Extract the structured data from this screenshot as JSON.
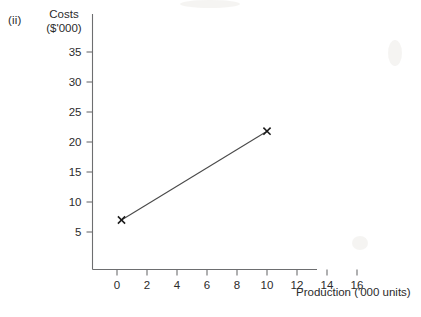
{
  "figure": {
    "part_label": "(ii)",
    "y_axis_title_line1": "Costs",
    "y_axis_title_line2": "($'000)",
    "x_axis_title": "Production ('000 units)"
  },
  "chart_data": {
    "type": "line",
    "title": "",
    "subtitle": "",
    "xlabel": "Production ('000 units)",
    "ylabel": "Costs ($'000)",
    "xlim": [
      0,
      17
    ],
    "ylim": [
      0,
      37
    ],
    "grid": false,
    "legend": null,
    "x_ticks": [
      0,
      2,
      4,
      6,
      8,
      10,
      12,
      14,
      16
    ],
    "x_tick_labels": [
      "0",
      "2",
      "4",
      "6",
      "8",
      "10",
      "12",
      "14",
      "16"
    ],
    "y_ticks": [
      5,
      10,
      15,
      20,
      25,
      30,
      35
    ],
    "y_tick_labels": [
      "5",
      "10",
      "15",
      "20",
      "25",
      "30",
      "35"
    ],
    "series": [
      {
        "name": "Total cost",
        "marker": "x",
        "color": "#333333",
        "x": [
          0.3,
          10
        ],
        "y": [
          7,
          21.8
        ],
        "points": [
          {
            "x": 0.3,
            "y": 7,
            "label": "x"
          },
          {
            "x": 10,
            "y": 21.8,
            "label": "x"
          }
        ]
      }
    ],
    "annotations": [
      {
        "text": "(ii)",
        "x_px": 8,
        "y_px": 20
      }
    ]
  }
}
